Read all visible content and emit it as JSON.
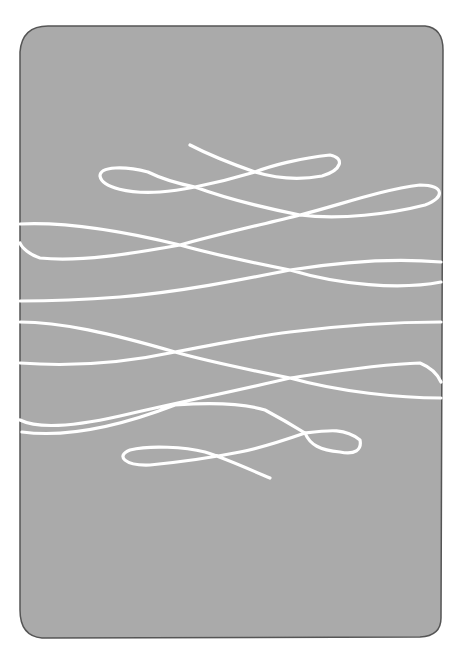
{
  "illustration": {
    "description": "Gray rounded rectangle with a single continuous white hand-drawn line looping back and forth",
    "colors": {
      "page_background": "#ffffff",
      "panel_fill": "#aaaaaa",
      "panel_border": "#555555",
      "line": "#ffffff"
    }
  }
}
